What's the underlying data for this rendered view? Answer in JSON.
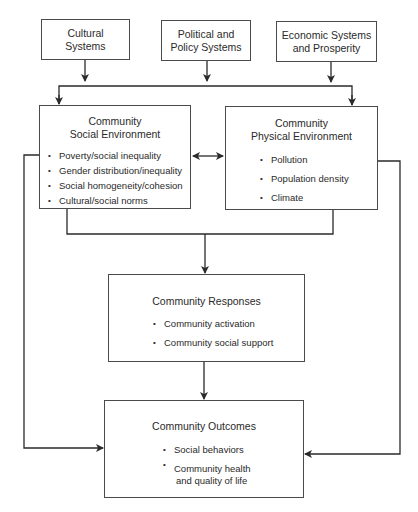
{
  "diagram": {
    "top_boxes": [
      {
        "id": "cultural",
        "line1": "Cultural",
        "line2": "Systems"
      },
      {
        "id": "political",
        "line1": "Political and",
        "line2": "Policy Systems"
      },
      {
        "id": "economic",
        "line1": "Economic Systems",
        "line2": "and Prosperity"
      }
    ],
    "social_env": {
      "title_line1": "Community",
      "title_line2": "Social Environment",
      "items": [
        "Poverty/social inequality",
        "Gender distribution/inequality",
        "Social homogeneity/cohesion",
        "Cultural/social norms"
      ]
    },
    "physical_env": {
      "title_line1": "Community",
      "title_line2": "Physical Environment",
      "items": [
        "Pollution",
        "Population density",
        "Climate"
      ]
    },
    "responses": {
      "title": "Community Responses",
      "items": [
        "Community activation",
        "Community social support"
      ]
    },
    "outcomes": {
      "title": "Community Outcomes",
      "items": [
        "Social behaviors"
      ],
      "item2_line1": "Community health",
      "item2_line2": "and quality of life"
    },
    "colors": {
      "line": "#2a2a2a",
      "border": "#4a4a4a",
      "text": "#2a2a2a",
      "background": "#ffffff"
    }
  }
}
